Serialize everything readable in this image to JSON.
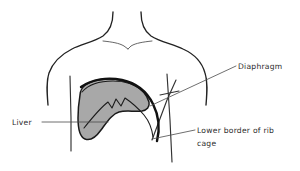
{
  "figure": {
    "background_color": "#ffffff",
    "line_color": "#222222",
    "organ_fill_color": "#a8a8a8",
    "label_color": "#2b2b2b"
  },
  "labels": {
    "diaphragm": {
      "text": "Diaphragm",
      "x": 238,
      "y": 69
    },
    "liver": {
      "text": "Liver",
      "x": 12,
      "y": 125
    },
    "rib_cage_line1": {
      "text": "Lower border of rib",
      "x": 197,
      "y": 133
    },
    "rib_cage_line2": {
      "text": "cage",
      "x": 197,
      "y": 146
    }
  },
  "structures": [
    {
      "name": "torso-outline",
      "label": "Torso, neck and shoulders outline",
      "kind": "outline"
    },
    {
      "name": "clavicle-notch",
      "label": "Clavicles and sternal notch",
      "kind": "outline"
    },
    {
      "name": "liver",
      "label": "Liver",
      "kind": "organ",
      "fill": "#a8a8a8"
    },
    {
      "name": "diaphragm",
      "label": "Diaphragm",
      "kind": "muscle"
    },
    {
      "name": "rib-cage-lower-border",
      "label": "Lower border of rib cage",
      "kind": "skeletal"
    }
  ]
}
